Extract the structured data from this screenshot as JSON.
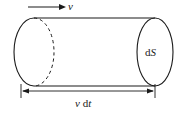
{
  "figure": {
    "background_color": "#ffffff",
    "stroke_color": "#1a1a1a",
    "labels": {
      "velocity": "v",
      "area_element_d": "d",
      "area_element_S": "S",
      "length_v": "v",
      "length_d": "d",
      "length_t": "t"
    },
    "icons": {
      "velocity_arrow": "arrow-right-icon",
      "dimension_line": "dimension-double-arrow-icon"
    },
    "geometry": {
      "left_cap_center_x": 34,
      "left_cap_center_y": 52,
      "left_cap_rx": 20,
      "left_cap_ry": 34,
      "right_cap_center_x": 155,
      "right_cap_center_y": 52,
      "right_cap_rx": 18,
      "right_cap_ry": 34,
      "top_edge_y": 18,
      "bottom_edge_y": 86,
      "dimension_line_y": 91,
      "dimension_left_x": 21,
      "dimension_right_x": 155,
      "velocity_arrow_start_x": 28,
      "velocity_arrow_end_x": 66,
      "velocity_arrow_y": 7
    }
  }
}
